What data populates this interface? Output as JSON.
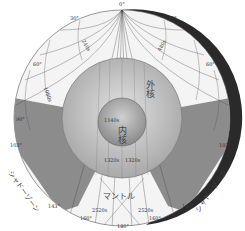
{
  "diagram": {
    "regions": {
      "outer_core": "外核",
      "inner_core": "内核",
      "mantle": "マントル",
      "shadow_zone_left": "シャドーゾーン",
      "shadow_zone_right": "シャドーゾーン"
    },
    "angle_labels": {
      "top": "0°",
      "left_30": "30°",
      "right_30": "30°",
      "left_60": "60°",
      "right_60": "60°",
      "left_90": "90°",
      "left_103": "103°",
      "right_103": "103°",
      "left_143": "143°",
      "right_143": "143°",
      "left_160": "160°",
      "right_160": "160°",
      "bottom": "180°"
    },
    "time_labels": {
      "t240_left": "240s",
      "t480_right": "480s",
      "t1080_left": "1080s",
      "t1140_left": "1140s",
      "t1320_left": "1320s",
      "t1320_right": "1320s",
      "t2520_left": "2520s",
      "t2520_right": "2520s"
    },
    "colors": {
      "shadow": "#8c8c8c",
      "outer_core": "#bdbdbd",
      "inner_core": "#9e9e9e",
      "mantle": "#f4f4f4",
      "rim": "#1a1a1a"
    }
  }
}
